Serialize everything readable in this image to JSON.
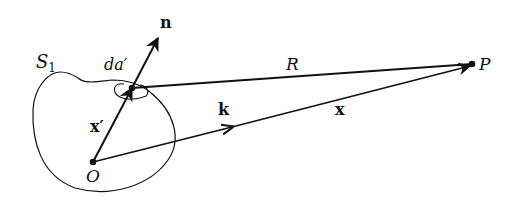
{
  "diagram": {
    "labels": {
      "surface": "S",
      "surface_sub": "1",
      "area_element": "da′",
      "normal": "n",
      "source_position": "x′",
      "wave_vector": "k",
      "field_position": "x",
      "distance": "R",
      "origin": "O",
      "observation_point": "P"
    },
    "colors": {
      "stroke": "#111111",
      "background": "#ffffff"
    }
  }
}
